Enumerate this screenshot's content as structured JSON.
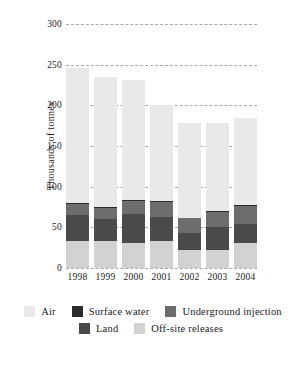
{
  "chart_data": {
    "type": "bar",
    "subtype": "stacked-vertical",
    "title": "",
    "xlabel": "",
    "ylabel": "Thousands of tonnes",
    "ylim": [
      0,
      300
    ],
    "yticks": [
      0,
      50,
      100,
      150,
      200,
      250,
      300
    ],
    "ytick_labels": [
      "0",
      "50",
      "100",
      "150",
      "200",
      "250",
      "300"
    ],
    "grid": "horizontal-dashed",
    "legend_position": "bottom",
    "categories": [
      "1998",
      "1999",
      "2000",
      "2001",
      "2002",
      "2003",
      "2004"
    ],
    "stack_order_bottom_to_top": [
      "Off-site releases",
      "Land",
      "Underground injection",
      "Surface water",
      "Air"
    ],
    "series": [
      {
        "name": "Off-site releases",
        "color": "#d2d2d2",
        "values": [
          33,
          33,
          31,
          33,
          22,
          22,
          31
        ]
      },
      {
        "name": "Land",
        "color": "#4a4a4a",
        "values": [
          32,
          27,
          35,
          30,
          21,
          28,
          23
        ]
      },
      {
        "name": "Underground injection",
        "color": "#6d6d6d",
        "values": [
          14,
          14,
          17,
          18,
          18,
          19,
          22
        ]
      },
      {
        "name": "Surface water",
        "color": "#2b2b2b",
        "values": [
          1,
          1,
          1,
          1,
          1,
          1,
          1
        ]
      },
      {
        "name": "Air",
        "color": "#e9e9e9",
        "values": [
          166,
          160,
          147,
          118,
          116,
          108,
          108
        ]
      }
    ],
    "totals": [
      246,
      235,
      231,
      200,
      178,
      178,
      185
    ]
  },
  "legend": {
    "rows": [
      [
        {
          "label": "Air",
          "color": "#e9e9e9"
        },
        {
          "label": "Surface water",
          "color": "#2b2b2b"
        },
        {
          "label": "Underground injection",
          "color": "#6d6d6d"
        }
      ],
      [
        {
          "label": "Land",
          "color": "#4a4a4a"
        },
        {
          "label": "Off-site releases",
          "color": "#d2d2d2"
        }
      ]
    ]
  }
}
